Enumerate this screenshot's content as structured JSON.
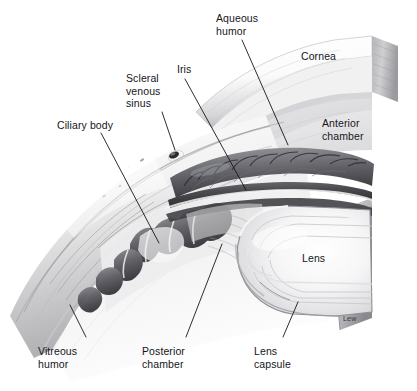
{
  "figure": {
    "background_color": "#ffffff",
    "ink_color": "#16161a",
    "style": "grayscale pencil/airbrush medical illustration"
  },
  "labels": {
    "aqueous_humor": "Aqueous\nhumor",
    "scleral_venous_sinus": "Scleral\nvenous\nsinus",
    "iris": "Iris",
    "ciliary_body": "Ciliary body",
    "cornea": "Cornea",
    "anterior_chamber": "Anterior\nchamber",
    "lens": "Lens",
    "vitreous_humor": "Vitreous\nhumor",
    "posterior_chamber": "Posterior\nchamber",
    "lens_capsule": "Lens\ncapsule"
  },
  "signature": "Lew",
  "leader_lines": [
    {
      "name": "aqueous-humor-leader",
      "from": [
        243,
        40
      ],
      "to": [
        287,
        144
      ]
    },
    {
      "name": "scleral-venous-sinus-leader",
      "from": [
        161,
        112
      ],
      "to": [
        176,
        152
      ]
    },
    {
      "name": "iris-leader",
      "from": [
        186,
        80
      ],
      "to": [
        246,
        191
      ]
    },
    {
      "name": "ciliary-body-leader",
      "from": [
        102,
        133
      ],
      "to": [
        159,
        244
      ]
    },
    {
      "name": "aqueous-humor-cornea-leader",
      "from": [
        243,
        40
      ],
      "to": [
        287,
        146
      ]
    },
    {
      "name": "vitreous-humor-leader",
      "from": [
        86,
        338
      ],
      "to": [
        71,
        306
      ]
    },
    {
      "name": "posterior-chamber-leader",
      "from": [
        185,
        338
      ],
      "to": [
        222,
        245
      ]
    },
    {
      "name": "lens-capsule-leader",
      "from": [
        283,
        338
      ],
      "to": [
        298,
        303
      ]
    }
  ]
}
